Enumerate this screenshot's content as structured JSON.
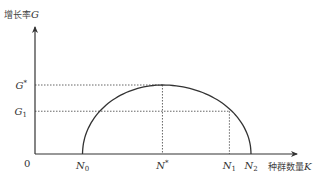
{
  "chart_data": {
    "type": "line",
    "title": "",
    "xlabel": "种群数量K",
    "ylabel": "增长率G",
    "origin_label": "0",
    "x_ticks": [
      {
        "name": "N0",
        "base": "N",
        "sub": "0",
        "sup": "",
        "value": 0.22
      },
      {
        "name": "N*",
        "base": "N",
        "sub": "",
        "sup": "*",
        "value": 0.59
      },
      {
        "name": "N1",
        "base": "N",
        "sub": "1",
        "sup": "",
        "value": 0.9
      },
      {
        "name": "N2",
        "base": "N",
        "sub": "2",
        "sup": "",
        "value": 1.0
      }
    ],
    "y_ticks": [
      {
        "name": "G*",
        "base": "G",
        "sub": "",
        "sup": "*",
        "value": 1.0
      },
      {
        "name": "G1",
        "base": "G",
        "sub": "1",
        "sup": "",
        "value": 0.62
      }
    ],
    "curve": {
      "description": "Hump-shaped growth-rate curve rising from N0 to maximum G* at N*, falling through G1 at N1 to zero at N2",
      "points": [
        {
          "x": 0.22,
          "y": 0.0
        },
        {
          "x": 0.59,
          "y": 1.0
        },
        {
          "x": 0.9,
          "y": 0.62
        },
        {
          "x": 1.0,
          "y": 0.0
        }
      ]
    },
    "guides": [
      {
        "from": "G*",
        "to": "N*"
      },
      {
        "from": "G1",
        "to": "N1"
      }
    ],
    "xlim": [
      0,
      1.15
    ],
    "ylim": [
      0,
      1.6
    ],
    "grid": false,
    "legend": "none"
  }
}
